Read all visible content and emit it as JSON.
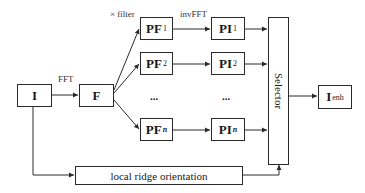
{
  "diagram": {
    "nodes": {
      "input": {
        "main": "I",
        "sub": ""
      },
      "fft": {
        "main": "F",
        "sub": ""
      },
      "pf1": {
        "main": "PF",
        "sub": "1"
      },
      "pf2": {
        "main": "PF",
        "sub": "2"
      },
      "pfn": {
        "main": "PF",
        "sub": "n"
      },
      "pi1": {
        "main": "PI",
        "sub": "1"
      },
      "pi2": {
        "main": "PI",
        "sub": "2"
      },
      "pin": {
        "main": "PI",
        "sub": "n"
      },
      "selector": {
        "main": "Selector"
      },
      "output": {
        "main": "I",
        "sub": "enh"
      },
      "orientation": {
        "main": "local ridge orientation"
      }
    },
    "edge_labels": {
      "fft": "FFT",
      "filter": "× filter",
      "invfft": "invFFT"
    },
    "ellipsis": "...",
    "edges": [
      {
        "from": "I",
        "to": "F",
        "label": "FFT"
      },
      {
        "from": "F",
        "to": "PF1",
        "label": "× filter"
      },
      {
        "from": "F",
        "to": "PF2"
      },
      {
        "from": "F",
        "to": "PFn"
      },
      {
        "from": "PF1",
        "to": "PI1",
        "label": "invFFT"
      },
      {
        "from": "PF2",
        "to": "PI2"
      },
      {
        "from": "PFn",
        "to": "PIn"
      },
      {
        "from": "PI1",
        "to": "Selector"
      },
      {
        "from": "PI2",
        "to": "Selector"
      },
      {
        "from": "PIn",
        "to": "Selector"
      },
      {
        "from": "I",
        "to": "local ridge orientation"
      },
      {
        "from": "local ridge orientation",
        "to": "Selector"
      },
      {
        "from": "Selector",
        "to": "Ienh"
      }
    ]
  }
}
